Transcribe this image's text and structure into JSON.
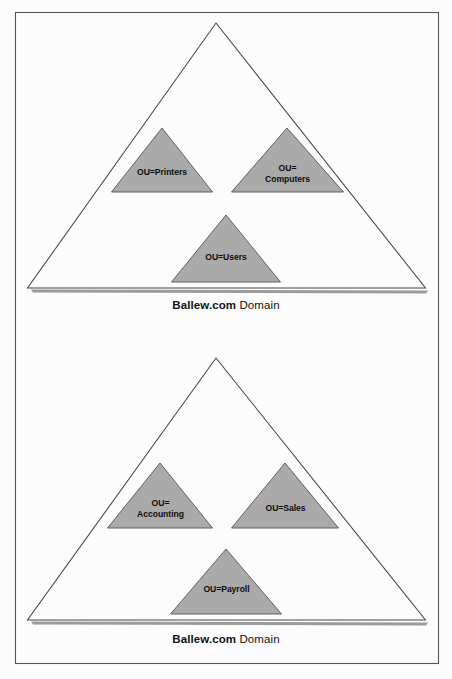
{
  "figure": {
    "type": "diagram",
    "background_color": "#fcfcfc",
    "frame_color": "#555555",
    "triangle_outline_color": "#444444",
    "ou_fill_color": "#aaaaaa",
    "shadow_color": "#8a8a8a"
  },
  "diagrams": [
    {
      "id": "top-domain",
      "caption": {
        "name": "Ballew.com",
        "suffix": " Domain"
      },
      "ou_units": [
        {
          "id": "printers",
          "lines": [
            "OU=Printers"
          ]
        },
        {
          "id": "computers",
          "lines": [
            "OU=",
            "Computers"
          ]
        },
        {
          "id": "users",
          "lines": [
            "OU=Users"
          ]
        }
      ]
    },
    {
      "id": "bottom-domain",
      "caption": {
        "name": "Ballew.com",
        "suffix": " Domain"
      },
      "ou_units": [
        {
          "id": "accounting",
          "lines": [
            "OU=",
            "Accounting"
          ]
        },
        {
          "id": "sales",
          "lines": [
            "OU=Sales"
          ]
        },
        {
          "id": "payroll",
          "lines": [
            "OU=Payroll"
          ]
        }
      ]
    }
  ]
}
